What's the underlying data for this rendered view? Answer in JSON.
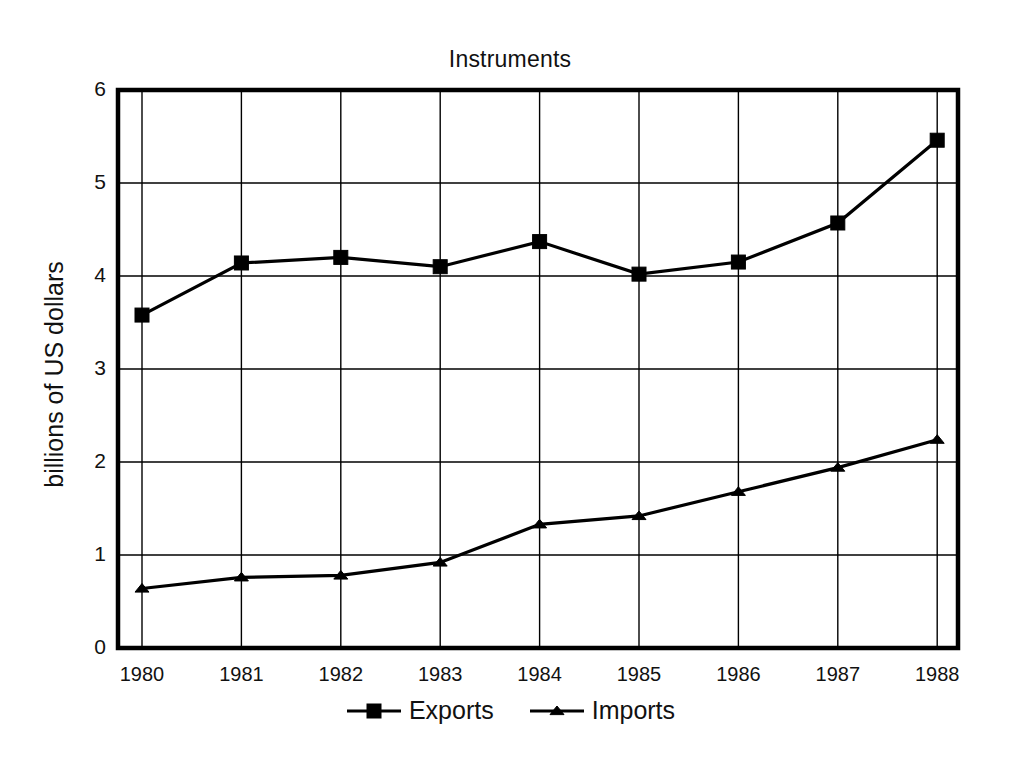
{
  "chart_data": {
    "type": "line",
    "title": "Instruments",
    "xlabel": "",
    "ylabel": "billions of US dollars",
    "categories": [
      "1980",
      "1981",
      "1982",
      "1983",
      "1984",
      "1985",
      "1986",
      "1987",
      "1988"
    ],
    "x": [
      1980,
      1981,
      1982,
      1983,
      1984,
      1985,
      1986,
      1987,
      1988
    ],
    "ylim": [
      0,
      6
    ],
    "yticks": [
      0,
      1,
      2,
      3,
      4,
      5,
      6
    ],
    "ytick_labels": [
      "0",
      "1",
      "2",
      "3",
      "4",
      "5",
      "6"
    ],
    "grid": true,
    "legend_position": "bottom-center",
    "series": [
      {
        "name": "Exports",
        "marker": "square",
        "color": "#000000",
        "values": [
          3.58,
          4.14,
          4.2,
          4.1,
          4.37,
          4.02,
          4.15,
          4.57,
          5.46
        ]
      },
      {
        "name": "Imports",
        "marker": "triangle",
        "color": "#000000",
        "values": [
          0.64,
          0.76,
          0.78,
          0.92,
          1.33,
          1.42,
          1.68,
          1.94,
          2.24
        ]
      }
    ]
  },
  "legend": {
    "entries": [
      {
        "label": "Exports",
        "marker": "square-marker-icon"
      },
      {
        "label": "Imports",
        "marker": "triangle-marker-icon"
      }
    ]
  },
  "axes": {
    "y_title": "billions of US dollars"
  }
}
